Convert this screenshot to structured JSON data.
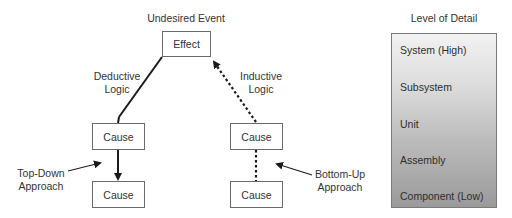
{
  "diagram": {
    "top_label": "Undesired Event",
    "effect_box": "Effect",
    "deductive_label": [
      "Deductive",
      "Logic"
    ],
    "inductive_label": [
      "Inductive",
      "Logic"
    ],
    "left_chain": {
      "upper": "Cause",
      "lower": "Cause"
    },
    "right_chain": {
      "upper": "Cause",
      "lower": "Cause"
    },
    "top_down_label": [
      "Top-Down",
      "Approach"
    ],
    "bottom_up_label": [
      "Bottom-Up",
      "Approach"
    ]
  },
  "level_of_detail": {
    "title": "Level of Detail",
    "levels": [
      "System (High)",
      "Subsystem",
      "Unit",
      "Assembly",
      "Component (Low)"
    ]
  },
  "colors": {
    "line": "#1a1a1a",
    "box_border": "#6a6a6a",
    "gradient_top": "#f2f2f2",
    "gradient_bottom": "#9a9a9a"
  }
}
